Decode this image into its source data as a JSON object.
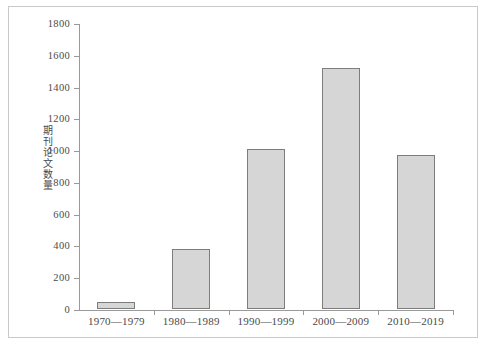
{
  "chart_data": {
    "type": "bar",
    "title": "",
    "xlabel": "",
    "ylabel": "期刊论文数量",
    "categories": [
      "1970—1979",
      "1980—1989",
      "1990—1999",
      "2000—2009",
      "2010—2019"
    ],
    "values": [
      44,
      375,
      1005,
      1515,
      968
    ],
    "series": [
      {
        "name": "期刊论文数量",
        "values": [
          44,
          375,
          1005,
          1515,
          968
        ]
      }
    ],
    "ylim": [
      0,
      1800
    ],
    "ytick_step": 200,
    "yticks": [
      0,
      200,
      400,
      600,
      800,
      1000,
      1200,
      1400,
      1600,
      1800
    ],
    "ytick_labels": [
      "0",
      "200",
      "400",
      "600",
      "800",
      "1000",
      "1200",
      "1400",
      "1600",
      "1800"
    ],
    "grid": false,
    "legend": false,
    "legend_position": "none",
    "colors": {
      "bar_fill": "#d6d6d6",
      "bar_stroke": "#7d7d7d",
      "axis": "#9a9a9a",
      "text": "#4a4a4a",
      "background": "#ffffff",
      "frame_border": "#c9c9c9"
    }
  }
}
